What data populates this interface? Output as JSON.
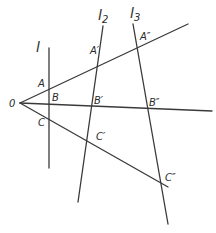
{
  "diagram": {
    "title": "",
    "vertex": {
      "label": "0",
      "x": 20,
      "y": 103
    },
    "rays": [
      {
        "name": "ray-oa",
        "from": [
          20,
          103
        ],
        "to": [
          188,
          24
        ]
      },
      {
        "name": "ray-ob",
        "from": [
          20,
          103
        ],
        "to": [
          212,
          111
        ]
      },
      {
        "name": "ray-oc",
        "from": [
          20,
          103
        ],
        "to": [
          168,
          187
        ]
      }
    ],
    "transversals": [
      {
        "name": "line-l",
        "label": "l",
        "sub": "",
        "from": [
          49,
          48
        ],
        "to": [
          49,
          168
        ],
        "label_pos": [
          36,
          52
        ]
      },
      {
        "name": "line-l2",
        "label": "l",
        "sub": "2",
        "from": [
          103,
          26
        ],
        "to": [
          78,
          202
        ],
        "label_pos": [
          98,
          20
        ]
      },
      {
        "name": "line-l3",
        "label": "l",
        "sub": "3",
        "from": [
          133,
          24
        ],
        "to": [
          168,
          224
        ],
        "label_pos": [
          130,
          18
        ]
      }
    ],
    "points": [
      {
        "label": "A",
        "pos": [
          38,
          87
        ]
      },
      {
        "label": "A′",
        "pos": [
          90,
          54
        ]
      },
      {
        "label": "A″",
        "pos": [
          140,
          40
        ]
      },
      {
        "label": "B",
        "pos": [
          52,
          101
        ]
      },
      {
        "label": "B′",
        "pos": [
          94,
          104
        ]
      },
      {
        "label": "B″",
        "pos": [
          149,
          106
        ]
      },
      {
        "label": "C",
        "pos": [
          38,
          126
        ]
      },
      {
        "label": "C′",
        "pos": [
          96,
          140
        ]
      },
      {
        "label": "C″",
        "pos": [
          165,
          181
        ]
      }
    ],
    "colors": {
      "stroke": "#3a3a3a",
      "text": "#2a2a2a",
      "background": "#ffffff"
    }
  }
}
